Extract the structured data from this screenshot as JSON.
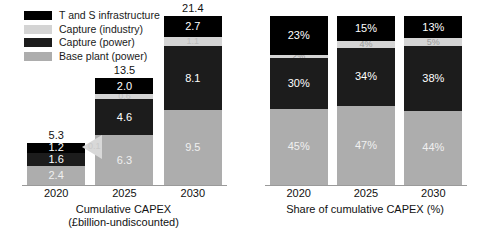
{
  "legend": {
    "items": [
      {
        "label": "T and S infrastructure",
        "color": "#000000",
        "key": "ts_infrastructure"
      },
      {
        "label": "Capture (industry)",
        "color": "#d4d4d4",
        "key": "capture_industry"
      },
      {
        "label": "Capture (power)",
        "color": "#1c1c1c",
        "key": "capture_power"
      },
      {
        "label": "Base plant (power)",
        "color": "#adadad",
        "key": "base_plant_power"
      }
    ]
  },
  "watermark": {
    "text": "0.1"
  },
  "chart_data": [
    {
      "type": "bar",
      "id": "cumulative-capex",
      "title": "Cumulative CAPEX",
      "subtitle": "(£billion-undiscounted)",
      "stacked": true,
      "xlabel": "",
      "ylabel": "",
      "grid": false,
      "legend_position": "top-left",
      "categories": [
        "2020",
        "2025",
        "2030"
      ],
      "totals": [
        5.3,
        13.5,
        21.4
      ],
      "total_labels": [
        "5.3",
        "13.5",
        "21.4"
      ],
      "ylim": [
        0,
        21.4
      ],
      "series": [
        {
          "name": "T and S infrastructure",
          "color": "#000000",
          "text_color": "#ffffff",
          "values": [
            1.2,
            2.0,
            2.7
          ],
          "labels": [
            "1.2",
            "2.0",
            "2.7"
          ]
        },
        {
          "name": "Capture (industry)",
          "color": "#d4d4d4",
          "text_color": "#bdbdbd",
          "values": [
            0.1,
            0.6,
            1.1
          ],
          "labels": [
            "",
            "0.6",
            "1.1"
          ]
        },
        {
          "name": "Capture (power)",
          "color": "#1c1c1c",
          "text_color": "#ffffff",
          "values": [
            1.6,
            4.6,
            8.1
          ],
          "labels": [
            "1.6",
            "4.6",
            "8.1"
          ]
        },
        {
          "name": "Base plant (power)",
          "color": "#adadad",
          "text_color": "#f0f0f0",
          "values": [
            2.4,
            6.3,
            9.5
          ],
          "labels": [
            "2.4",
            "6.3",
            "9.5"
          ]
        }
      ]
    },
    {
      "type": "bar",
      "id": "share-cumulative-capex",
      "title": "Share of cumulative CAPEX (%)",
      "subtitle": "",
      "stacked": true,
      "xlabel": "",
      "ylabel": "",
      "grid": false,
      "legend_position": "none",
      "categories": [
        "2020",
        "2025",
        "2030"
      ],
      "totals": [
        100,
        100,
        100
      ],
      "total_labels": [
        "",
        "",
        ""
      ],
      "ylim": [
        0,
        100
      ],
      "series": [
        {
          "name": "T and S infrastructure",
          "color": "#000000",
          "text_color": "#ffffff",
          "values": [
            23,
            15,
            13
          ],
          "labels": [
            "23%",
            "15%",
            "13%"
          ]
        },
        {
          "name": "Capture (industry)",
          "color": "#d4d4d4",
          "text_color": "#9a9a9a",
          "values": [
            2,
            4,
            5
          ],
          "labels": [
            "2%",
            "4%",
            "5%"
          ]
        },
        {
          "name": "Capture (power)",
          "color": "#1c1c1c",
          "text_color": "#ffffff",
          "values": [
            30,
            34,
            38
          ],
          "labels": [
            "30%",
            "34%",
            "38%"
          ]
        },
        {
          "name": "Base plant (power)",
          "color": "#adadad",
          "text_color": "#f0f0f0",
          "values": [
            45,
            47,
            44
          ],
          "labels": [
            "45%",
            "47%",
            "44%"
          ]
        }
      ]
    }
  ]
}
